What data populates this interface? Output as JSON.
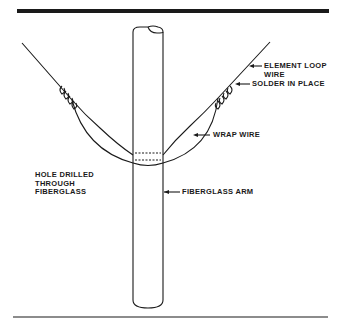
{
  "figure": {
    "type": "technical-illustration",
    "colors": {
      "ink": "#1a1a1a",
      "background": "#ffffff"
    }
  },
  "labels": {
    "element_loop_wire": [
      "ELEMENT LOOP",
      "WIRE"
    ],
    "solder_in_place": "SOLDER IN PLACE",
    "wrap_wire": "WRAP WIRE",
    "hole_drilled": [
      "HOLE DRILLED",
      "THROUGH",
      "FIBERGLASS"
    ],
    "fiberglass_arm": "FIBERGLASS ARM"
  }
}
